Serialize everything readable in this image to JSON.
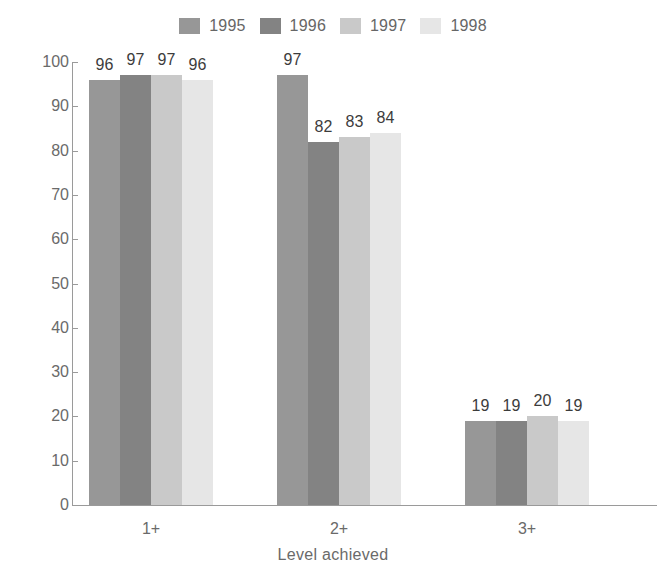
{
  "chart_data": {
    "type": "bar",
    "title": "",
    "subtitle": "",
    "xlabel": "Level achieved",
    "ylabel": "",
    "categories": [
      "1+",
      "2+",
      "3+"
    ],
    "series": [
      {
        "name": "1995",
        "values": [
          96,
          97,
          19
        ],
        "color": "#979797"
      },
      {
        "name": "1996",
        "values": [
          97,
          82,
          19
        ],
        "color": "#838383"
      },
      {
        "name": "1997",
        "values": [
          97,
          83,
          20
        ],
        "color": "#c9c9c9"
      },
      {
        "name": "1998",
        "values": [
          96,
          84,
          19
        ],
        "color": "#e6e6e6"
      }
    ],
    "ylim": [
      0,
      100
    ],
    "yticks": [
      0,
      10,
      20,
      30,
      40,
      50,
      60,
      70,
      80,
      90,
      100
    ],
    "ytick_labels": [
      "0",
      "10",
      "20",
      "30",
      "40",
      "50",
      "60",
      "70",
      "80",
      "90",
      "100"
    ],
    "grid": false,
    "legend_position": "top-right",
    "data_labels": true
  },
  "legend": {
    "items": [
      {
        "label": "1995",
        "color": "#979797"
      },
      {
        "label": "1996",
        "color": "#838383"
      },
      {
        "label": "1997",
        "color": "#c9c9c9"
      },
      {
        "label": "1998",
        "color": "#e6e6e6"
      }
    ]
  },
  "axis": {
    "x_title": "Level achieved",
    "y_ticks": [
      "0",
      "10",
      "20",
      "30",
      "40",
      "50",
      "60",
      "70",
      "80",
      "90",
      "100"
    ],
    "x_categories": [
      "1+",
      "2+",
      "3+"
    ]
  }
}
